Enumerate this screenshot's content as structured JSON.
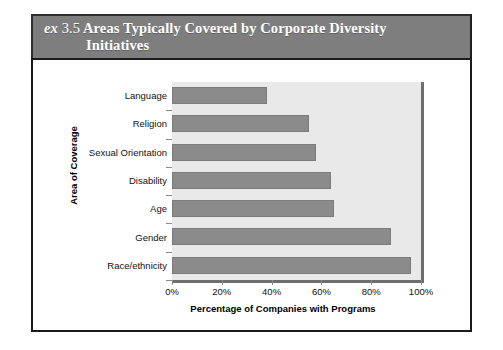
{
  "exhibit": {
    "tag": "ex",
    "number": "3.5",
    "title_line1": "Areas Typically Covered by Corporate Diversity",
    "title_line2": "Initiatives",
    "band_color": "#7e7e7e",
    "band_text_color": "#ffffff"
  },
  "chart_data": {
    "type": "bar",
    "orientation": "horizontal",
    "title": "Areas Typically Covered by Corporate Diversity Initiatives",
    "categories": [
      "Language",
      "Religion",
      "Sexual Orientation",
      "Disability",
      "Age",
      "Gender",
      "Race/ethnicity"
    ],
    "values": [
      38,
      55,
      58,
      64,
      65,
      88,
      96
    ],
    "xlabel": "Percentage of Companies with Programs",
    "ylabel": "Area of Coverage",
    "xlim": [
      0,
      100
    ],
    "xticks": [
      0,
      20,
      40,
      60,
      80,
      100
    ],
    "xtick_labels": [
      "0%",
      "20%",
      "40%",
      "60%",
      "80%",
      "100%"
    ],
    "grid": false,
    "legend": "none",
    "bar_color": "#8b8b8b",
    "plot_background": "#e9e9e9"
  }
}
